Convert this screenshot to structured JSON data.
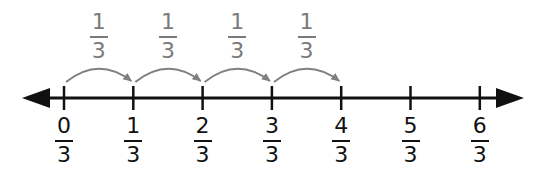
{
  "diagram": {
    "type": "number-line",
    "colors": {
      "axis": "#111111",
      "jump": "#808080",
      "background": "#ffffff"
    },
    "ticks": [
      {
        "numerator": "0",
        "denominator": "3"
      },
      {
        "numerator": "1",
        "denominator": "3"
      },
      {
        "numerator": "2",
        "denominator": "3"
      },
      {
        "numerator": "3",
        "denominator": "3"
      },
      {
        "numerator": "4",
        "denominator": "3"
      },
      {
        "numerator": "5",
        "denominator": "3"
      },
      {
        "numerator": "6",
        "denominator": "3"
      }
    ],
    "jumps": [
      {
        "from": 0,
        "to": 1,
        "numerator": "1",
        "denominator": "3"
      },
      {
        "from": 1,
        "to": 2,
        "numerator": "1",
        "denominator": "3"
      },
      {
        "from": 2,
        "to": 3,
        "numerator": "1",
        "denominator": "3"
      },
      {
        "from": 3,
        "to": 4,
        "numerator": "1",
        "denominator": "3"
      }
    ]
  }
}
